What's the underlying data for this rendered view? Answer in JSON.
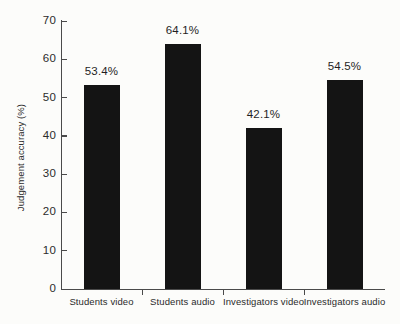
{
  "chart_data": {
    "type": "bar",
    "title": "",
    "xlabel": "",
    "ylabel": "Judgement accuracy (%)",
    "categories": [
      "Students video",
      "Students audio",
      "Investigators video",
      "Investigators audio"
    ],
    "values": [
      53.4,
      64.1,
      42.1,
      54.5
    ],
    "value_labels": [
      "53.4%",
      "64.1%",
      "42.1%",
      "54.5%"
    ],
    "ylim": [
      0,
      70
    ],
    "ytick_labels": [
      "0",
      "10",
      "20",
      "30",
      "40",
      "50",
      "60",
      "70"
    ],
    "ytick_values": [
      0,
      10,
      20,
      30,
      40,
      50,
      60,
      70
    ],
    "grid": false,
    "legend": false,
    "bar_color": "#141414",
    "axis_color": "#4a4a4a",
    "background_color": "#fcfcfa"
  }
}
